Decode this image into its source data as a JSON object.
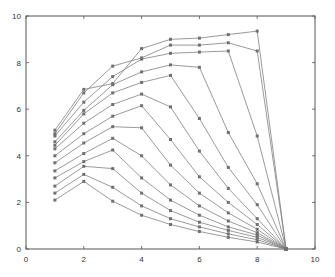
{
  "chart_data": {
    "type": "line",
    "title": "",
    "xlabel": "",
    "ylabel": "",
    "xlim": [
      0,
      10
    ],
    "ylim": [
      0,
      10
    ],
    "x_ticks": [
      "0",
      "2",
      "4",
      "6",
      "8",
      "10"
    ],
    "y_ticks": [
      "0",
      "2",
      "4",
      "6",
      "8",
      "10"
    ],
    "grid": false,
    "legend": null,
    "line_color": "#808080",
    "marker_color": "#707070",
    "series": [
      {
        "name": "s1",
        "points": [
          [
            1,
            2.1
          ],
          [
            2,
            2.9
          ],
          [
            3,
            2.05
          ],
          [
            4,
            1.45
          ],
          [
            5,
            1.05
          ],
          [
            6,
            0.75
          ],
          [
            7,
            0.5
          ],
          [
            8,
            0.3
          ],
          [
            9,
            0
          ]
        ]
      },
      {
        "name": "s2",
        "points": [
          [
            1,
            2.4
          ],
          [
            2,
            3.2
          ],
          [
            3,
            2.65
          ],
          [
            4,
            1.85
          ],
          [
            5,
            1.3
          ],
          [
            6,
            0.95
          ],
          [
            7,
            0.65
          ],
          [
            8,
            0.4
          ],
          [
            9,
            0
          ]
        ]
      },
      {
        "name": "s3",
        "points": [
          [
            1,
            2.7
          ],
          [
            2,
            3.55
          ],
          [
            3,
            3.45
          ],
          [
            4,
            2.4
          ],
          [
            5,
            1.65
          ],
          [
            6,
            1.15
          ],
          [
            7,
            0.8
          ],
          [
            8,
            0.5
          ],
          [
            9,
            0
          ]
        ]
      },
      {
        "name": "s4",
        "points": [
          [
            1,
            3.05
          ],
          [
            2,
            3.75
          ],
          [
            3,
            4.25
          ],
          [
            4,
            3.05
          ],
          [
            5,
            2.1
          ],
          [
            6,
            1.45
          ],
          [
            7,
            0.95
          ],
          [
            8,
            0.6
          ],
          [
            9,
            0
          ]
        ]
      },
      {
        "name": "s5",
        "points": [
          [
            1,
            3.35
          ],
          [
            2,
            4.1
          ],
          [
            3,
            4.75
          ],
          [
            4,
            4.0
          ],
          [
            5,
            2.75
          ],
          [
            6,
            1.85
          ],
          [
            7,
            1.2
          ],
          [
            8,
            0.7
          ],
          [
            9,
            0
          ]
        ]
      },
      {
        "name": "s6",
        "points": [
          [
            1,
            3.7
          ],
          [
            2,
            4.55
          ],
          [
            3,
            5.25
          ],
          [
            4,
            5.2
          ],
          [
            5,
            3.6
          ],
          [
            6,
            2.4
          ],
          [
            7,
            1.55
          ],
          [
            8,
            0.85
          ],
          [
            9,
            0
          ]
        ]
      },
      {
        "name": "s7",
        "points": [
          [
            1,
            4.0
          ],
          [
            2,
            4.95
          ],
          [
            3,
            5.7
          ],
          [
            4,
            6.15
          ],
          [
            5,
            4.7
          ],
          [
            6,
            3.1
          ],
          [
            7,
            2.0
          ],
          [
            8,
            1.05
          ],
          [
            9,
            0
          ]
        ]
      },
      {
        "name": "s8",
        "points": [
          [
            1,
            4.3
          ],
          [
            2,
            5.4
          ],
          [
            3,
            6.2
          ],
          [
            4,
            6.65
          ],
          [
            5,
            6.1
          ],
          [
            6,
            4.2
          ],
          [
            7,
            2.6
          ],
          [
            8,
            1.3
          ],
          [
            9,
            0
          ]
        ]
      },
      {
        "name": "s9",
        "points": [
          [
            1,
            4.45
          ],
          [
            2,
            5.8
          ],
          [
            3,
            6.7
          ],
          [
            4,
            7.15
          ],
          [
            5,
            7.45
          ],
          [
            6,
            5.6
          ],
          [
            7,
            3.5
          ],
          [
            8,
            1.9
          ],
          [
            9,
            0
          ]
        ]
      },
      {
        "name": "s10",
        "points": [
          [
            1,
            4.6
          ],
          [
            2,
            5.95
          ],
          [
            3,
            7.05
          ],
          [
            4,
            7.6
          ],
          [
            5,
            7.9
          ],
          [
            6,
            7.8
          ],
          [
            7,
            5.0
          ],
          [
            8,
            2.8
          ],
          [
            9,
            0
          ]
        ]
      },
      {
        "name": "s11",
        "points": [
          [
            1,
            4.85
          ],
          [
            2,
            6.3
          ],
          [
            3,
            7.4
          ],
          [
            4,
            8.15
          ],
          [
            5,
            8.4
          ],
          [
            6,
            8.45
          ],
          [
            7,
            8.5
          ],
          [
            8,
            4.85
          ],
          [
            9,
            0
          ]
        ]
      },
      {
        "name": "s12",
        "points": [
          [
            1,
            4.95
          ],
          [
            2,
            6.7
          ],
          [
            3,
            7.85
          ],
          [
            4,
            8.2
          ],
          [
            5,
            8.75
          ],
          [
            6,
            8.75
          ],
          [
            7,
            8.85
          ],
          [
            8,
            8.5
          ],
          [
            9,
            0
          ]
        ]
      },
      {
        "name": "s13",
        "points": [
          [
            1,
            5.1
          ],
          [
            2,
            6.85
          ],
          [
            3,
            7.1
          ],
          [
            4,
            8.6
          ],
          [
            5,
            9.0
          ],
          [
            6,
            9.05
          ],
          [
            7,
            9.2
          ],
          [
            8,
            9.35
          ],
          [
            9,
            0
          ]
        ]
      }
    ]
  }
}
